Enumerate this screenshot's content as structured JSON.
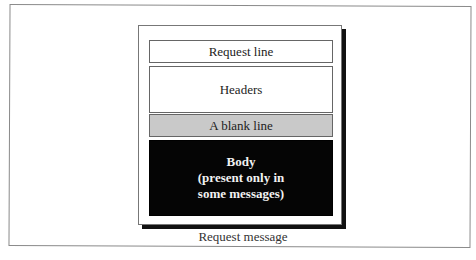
{
  "diagram": {
    "blocks": [
      {
        "label": "Request line",
        "fill": "#ffffff"
      },
      {
        "label": "Headers",
        "fill": "#ffffff"
      },
      {
        "label": "A blank line",
        "fill": "#c9c9c9"
      },
      {
        "label_lines": [
          "Body",
          "(present only in",
          "some messages)"
        ],
        "fill": "#050505",
        "text_color": "#f2f2f2"
      }
    ],
    "caption": "Request message"
  }
}
